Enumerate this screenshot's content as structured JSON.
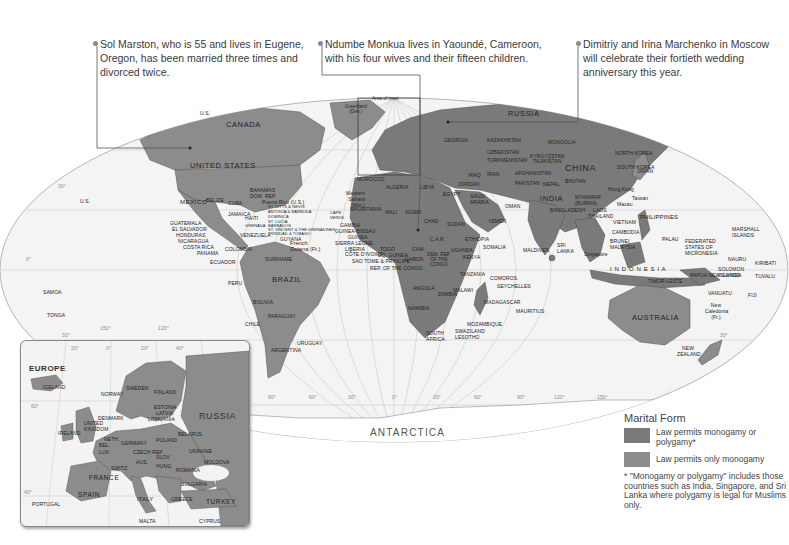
{
  "callouts": [
    {
      "text": "Sol Marston, who is 55 and lives in Eugene, Oregon, has been married three times and divorced twice."
    },
    {
      "text": "Ndumbe Monkua lives in Yaoundé, Cameroon, with his four wives and their fifteen children."
    },
    {
      "text": "Dimitriy and Irina Marchenko in Moscow will celebrate their fortieth wedding anniversary this year."
    }
  ],
  "map": {
    "inset_label": "Area of inset",
    "continent_labels": {
      "antarctica": "ANTARCTICA"
    },
    "major_countries": {
      "canada": "CANADA",
      "united_states": "UNITED STATES",
      "mexico": "MEXICO",
      "brazil": "BRAZIL",
      "russia": "RUSSIA",
      "china": "CHINA",
      "india": "INDIA",
      "australia": "AUSTRALIA",
      "indonesia": "I N D O N E S I A",
      "greenland": "Greenland (Den.)",
      "us_alaska": "U.S."
    },
    "americas": {
      "guatemala": "GUATEMALA",
      "el_salvador": "EL SALVADOR",
      "honduras": "HONDURAS",
      "nicaragua": "NICARAGUA",
      "costa_rica": "COSTA RICA",
      "panama": "PANAMA",
      "belize": "BELIZE",
      "cuba": "CUBA",
      "jamaica": "JAMAICA",
      "haiti": "HAITI",
      "bahamas": "BAHAMAS",
      "dom_rep": "DOM. REP.",
      "puerto_rico": "Puerto Rico (U.S.)",
      "st_kitts": "ST. KITTS & NEVIS",
      "antigua": "ANTIGUA & BARBUDA",
      "dominica": "DOMINICA",
      "st_lucia": "ST. LUCIA",
      "barbados": "BARBADOS",
      "st_vincent": "ST. VINCENT & THE GRENADINES",
      "grenada": "GRENADA",
      "trinidad": "TRINIDAD & TOBAGO",
      "venezuela": "VENEZUELA",
      "guyana": "GUYANA",
      "suriname": "SURINAME",
      "french_guiana": "French Guiana (Fr.)",
      "colombia": "COLOMBIA",
      "ecuador": "ECUADOR",
      "peru": "PERU",
      "bolivia": "BOLIVIA",
      "paraguay": "PARAGUAY",
      "chile": "CHILE",
      "uruguay": "URUGUAY",
      "argentina": "ARGENTINA",
      "us_hawaii": "U.S."
    },
    "africa_mideast": {
      "morocco": "MOROCCO",
      "western_sahara": "Western Sahara (Mor.)",
      "algeria": "ALGERIA",
      "libya": "LIBYA",
      "egypt": "EGYPT",
      "mauritania": "MAURITANIA",
      "mali": "MALI",
      "niger": "NIGER",
      "chad": "CHAD",
      "sudan": "SUDAN",
      "cape_verde": "CAPE VERDE",
      "senegal": "SENEGAL",
      "gambia": "GAMBIA",
      "guinea_bissau": "GUINEA-BISSAU",
      "guinea": "GUINEA",
      "sierra_leone": "SIERRA LEONE",
      "liberia": "LIBERIA",
      "cote_divoire": "CÔTE D'IVOIRE",
      "togo": "TOGO",
      "eq_guinea": "EQ. GUINEA",
      "sao_tome": "SAO TOME & PRINCIPE",
      "rep_congo": "REP. OF THE CONGO",
      "gabon": "GABON",
      "cameroon": "CAM.",
      "car": "C.A.R.",
      "ethiopia": "ETHIOPIA",
      "somalia": "SOMALIA",
      "dem_rep_congo": "DEM. REP. OF THE CONGO",
      "uganda": "UGANDA",
      "kenya": "KENYA",
      "rwanda": "RWANDA",
      "burundi": "BURUNDI",
      "tanzania": "TANZANIA",
      "angola": "ANGOLA",
      "zambia": "ZAMBIA",
      "malawi": "MALAWI",
      "namibia": "NAMIBIA",
      "zimbabwe": "ZIMBABWE",
      "botswana": "BOTSWANA",
      "mozambique": "MOZAMBIQUE",
      "south_africa": "SOUTH AFRICA",
      "swaziland": "SWAZILAND",
      "lesotho": "LESOTHO",
      "madagascar": "MADAGASCAR",
      "comoros": "COMOROS",
      "seychelles": "SEYCHELLES",
      "mauritius": "MAURITIUS",
      "saudi_arabia": "SAUDI ARABIA",
      "yemen": "YEMEN",
      "oman": "OMAN",
      "iraq": "IRAQ",
      "iran": "IRAN",
      "jordan": "JORDAN",
      "kuwait": "KUWAIT",
      "afghanistan": "AFGHANISTAN",
      "pakistan": "PAKISTAN",
      "kazakhstan": "KAZAKHSTAN",
      "mongolia": "MONGOLIA",
      "georgia": "GEORGIA",
      "kyrgyzstan": "KYRGYZSTAN",
      "tajikistan": "TAJIKISTAN",
      "uzbekistan": "UZBEKISTAN",
      "turkmenistan": "TURKMENISTAN"
    },
    "asia_pacific": {
      "north_korea": "NORTH KOREA",
      "south_korea": "SOUTH KOREA",
      "japan": "JAPAN",
      "nepal": "NEPAL",
      "bhutan": "BHUTAN",
      "bangladesh": "BANGLADESH",
      "myanmar": "MYANMAR (BURMA)",
      "laos": "LAOS",
      "thailand": "THAILAND",
      "vietnam": "VIETNAM",
      "cambodia": "CAMBODIA",
      "hong_kong": "Hong Kong",
      "macau": "Macau",
      "taiwan": "Taiwan",
      "philippines": "PHILIPPINES",
      "maldives": "MALDIVES",
      "sri_lanka": "SRI LANKA",
      "brunei": "BRUNEI",
      "malaysia": "MALAYSIA",
      "singapore": "Singapore",
      "timor_leste": "TIMOR-LESTE",
      "papua_new_guinea": "PAPUA NEW GUINEA",
      "palau": "PALAU",
      "micronesia": "FEDERATED STATES OF MICRONESIA",
      "marshall_islands": "MARSHALL ISLANDS",
      "nauru": "NAURU",
      "kiribati": "KIRIBATI",
      "solomon_islands": "SOLOMON ISLANDS",
      "tuvalu": "TUVALU",
      "vanuatu": "VANUATU",
      "fiji": "FIJI",
      "new_caledonia": "New Caledonia (Fr.)",
      "new_zealand": "NEW ZEALAND",
      "samoa": "SAMOA",
      "tonga": "TONGA"
    },
    "graticule": {
      "lat_labels": [
        "30°",
        "0°",
        "30°",
        "30°"
      ],
      "lon_labels_bottom": [
        "90°",
        "60°",
        "30°",
        "0°",
        "30°",
        "60°",
        "90°",
        "120°",
        "150°"
      ],
      "lon_labels_pacific": [
        "150°",
        "120°"
      ]
    }
  },
  "inset": {
    "title": "EUROPE",
    "lon_labels": [
      "20°",
      "0°",
      "20°",
      "40°"
    ],
    "lat_labels": [
      "60°",
      "40°"
    ],
    "countries": {
      "iceland": "ICELAND",
      "norway": "NORWAY",
      "sweden": "SWEDEN",
      "finland": "FINLAND",
      "russia": "RUSSIA",
      "estonia": "ESTONIA",
      "latvia": "LATVIA",
      "lithuania": "LITHUANIA",
      "denmark": "DENMARK",
      "united_kingdom": "UNITED KINGDOM",
      "ireland": "IRELAND",
      "neth": "NETH.",
      "bel": "BEL.",
      "lux": "LUX.",
      "germany": "GERMANY",
      "poland": "POLAND",
      "belarus": "BELARUS",
      "ukraine": "UKRAINE",
      "moldova": "MOLDOVA",
      "czech": "CZECH REP.",
      "slovakia": "SLOV.",
      "austria": "AUS.",
      "hungary": "HUNG.",
      "romania": "ROMANIA",
      "switz": "SWITZ.",
      "france": "FRANCE",
      "italy": "ITALY",
      "bulgaria": "BULGARIA",
      "greece": "GREECE",
      "spain": "SPAIN",
      "portugal": "PORTUGAL",
      "turkey": "TURKEY",
      "malta": "MALTA",
      "cyprus": "CYPRUS"
    }
  },
  "legend": {
    "title": "Marital Form",
    "items": [
      {
        "label": "Law permits monogamy or polygamy*",
        "color": "#7a7a7a"
      },
      {
        "label": "Law permits only monogamy",
        "color": "#8c8c8c"
      }
    ],
    "footnote": "* \"Monogamy or polygamy\" includes those countries such as India, Singapore, and Sri Lanka where polygamy is legal for Muslims only."
  },
  "colors": {
    "land_polygamy": "#7a7a7a",
    "land_monogamy": "#8c8c8c",
    "ocean": "#f2f2f2",
    "border": "#555555",
    "graticule": "#cfcfcf"
  }
}
